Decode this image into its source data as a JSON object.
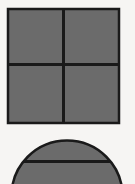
{
  "figure": {
    "title": "",
    "canvas": {
      "width": 135,
      "height": 184,
      "background_color": "#f6f5f3"
    },
    "palette": {
      "fill_gray": "#6b6b6b",
      "stroke_dark": "#1a1a1a",
      "background": "#f6f5f3"
    },
    "shapes": [
      {
        "id": "quartered-square",
        "name": "square-divided-in-four",
        "type": "square",
        "fill": "#6b6b6b",
        "stroke": "#1a1a1a",
        "stroke_width": 2,
        "x": 7,
        "y": 8,
        "width": 113,
        "height": 116,
        "divider_vertical_x": 63,
        "divider_horizontal_y": 64,
        "divider_width": 3,
        "parts": 4
      },
      {
        "id": "chorded-circle",
        "name": "circle-with-horizontal-chord",
        "type": "circle",
        "fill": "#6b6b6b",
        "stroke": "#1a1a1a",
        "stroke_width": 2,
        "center_x": 67,
        "center_y": 196,
        "radius": 56,
        "chord_y": 161,
        "chord_width": 3,
        "clipped_at_bottom": true
      }
    ]
  }
}
